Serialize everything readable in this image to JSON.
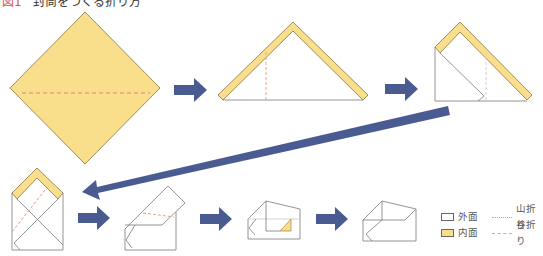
{
  "title": {
    "figure_label": "図1",
    "text": "封筒をつくる折り方"
  },
  "colors": {
    "paper_inner": "#f9df8b",
    "paper_edge": "#8a7440",
    "outline": "#7a7a7a",
    "arrow": "#4a5b92",
    "valley_fold": "#e9a08c",
    "mountain_fold": "#c8c8c8"
  },
  "steps": [
    {
      "id": 1,
      "description": "yellow square diamond with horizontal valley fold line"
    },
    {
      "id": 2,
      "description": "folded triangle with yellow band along top edges and vertical valley fold"
    },
    {
      "id": 3,
      "description": "side folded in, yellow band on diagonal edge"
    },
    {
      "id": 4,
      "description": "envelope shape with X creases and yellow top flap"
    },
    {
      "id": 5,
      "description": "flap folded with diagonal valley fold"
    },
    {
      "id": 6,
      "description": "box-like envelope with small yellow triangle"
    },
    {
      "id": 7,
      "description": "finished envelope"
    }
  ],
  "legend": {
    "items": [
      {
        "swatch": "outer",
        "label": "外面",
        "line": "mountain",
        "line_label": "山折り"
      },
      {
        "swatch": "inner",
        "label": "内面",
        "line": "valley",
        "line_label": "谷折り"
      }
    ]
  }
}
